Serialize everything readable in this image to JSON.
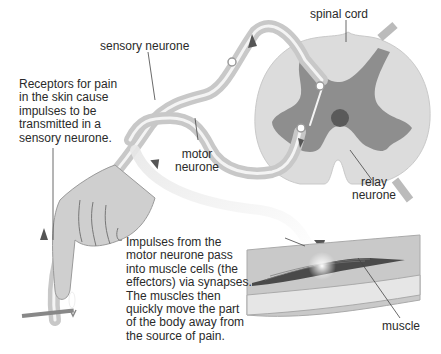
{
  "diagram": {
    "type": "reflex-arc",
    "labels": {
      "spinal_cord": "spinal cord",
      "sensory_neurone": "sensory neurone",
      "motor_neurone": "motor\nneurone",
      "relay_neurone": "relay\nneurone",
      "muscle": "muscle"
    },
    "annotations": {
      "receptors": "Receptors for pain\nin the skin cause\nimpulses to be\ntransmitted in a\nsensory neurone.",
      "impulses": "Impulses from the\nmotor neurone pass\ninto muscle cells (the\neffectors) via synapses.\nThe muscles then\nquickly move the part\nof the body away from\nthe source of pain."
    },
    "colors": {
      "grey_matter": "#8d8d8d",
      "white_matter": "#d9d9d9",
      "central_canal": "#5a5a5a",
      "nerve": "#c4c4c4",
      "skin": "#cfcfcf",
      "muscle_fibre": "#4a4a4a",
      "arrow": "#555555"
    }
  }
}
